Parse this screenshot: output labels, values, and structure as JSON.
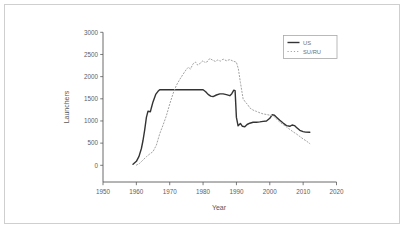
{
  "figure": {
    "background": "#ffffff",
    "border_color": "#cfcfcf"
  },
  "chart_data": {
    "type": "line",
    "title": "",
    "xlabel": "Year",
    "ylabel": "Launchers",
    "xlim": [
      1950,
      2020
    ],
    "ylim": [
      0,
      3000
    ],
    "xticks": [
      "1950",
      "1960",
      "1970",
      "1980",
      "1990",
      "2000",
      "2010",
      "2020"
    ],
    "yticks": [
      "0",
      "500",
      "1000",
      "1500",
      "2000",
      "2500",
      "3000"
    ],
    "grid": false,
    "axis_color": "#5a5a5a",
    "legend": {
      "position": "top-right",
      "entries": [
        "US",
        "SU/RU"
      ]
    },
    "series": [
      {
        "name": "US",
        "line_style": "solid",
        "color": "#333333",
        "points": [
          [
            1959,
            25
          ],
          [
            1960,
            90
          ],
          [
            1960.8,
            200
          ],
          [
            1961.5,
            380
          ],
          [
            1962,
            560
          ],
          [
            1962.5,
            800
          ],
          [
            1963,
            1080
          ],
          [
            1963.5,
            1220
          ],
          [
            1964.2,
            1210
          ],
          [
            1964.5,
            1300
          ],
          [
            1965,
            1430
          ],
          [
            1965.8,
            1600
          ],
          [
            1966.5,
            1670
          ],
          [
            1967,
            1705
          ],
          [
            1980,
            1705
          ],
          [
            1980.8,
            1660
          ],
          [
            1981.5,
            1600
          ],
          [
            1982.3,
            1560
          ],
          [
            1983,
            1550
          ],
          [
            1984,
            1585
          ],
          [
            1985,
            1610
          ],
          [
            1986,
            1610
          ],
          [
            1987,
            1595
          ],
          [
            1988,
            1570
          ],
          [
            1988.6,
            1615
          ],
          [
            1989.2,
            1695
          ],
          [
            1989.6,
            1685
          ],
          [
            1990,
            1080
          ],
          [
            1990.5,
            890
          ],
          [
            1991.2,
            945
          ],
          [
            1991.8,
            880
          ],
          [
            1992.5,
            870
          ],
          [
            1993.2,
            920
          ],
          [
            1994,
            950
          ],
          [
            1995,
            970
          ],
          [
            1996,
            970
          ],
          [
            1997,
            980
          ],
          [
            1998,
            990
          ],
          [
            1999,
            1000
          ],
          [
            2000,
            1060
          ],
          [
            2000.7,
            1140
          ],
          [
            2001.4,
            1130
          ],
          [
            2002,
            1085
          ],
          [
            2003,
            1015
          ],
          [
            2004,
            955
          ],
          [
            2005,
            895
          ],
          [
            2006,
            880
          ],
          [
            2006.7,
            910
          ],
          [
            2007.4,
            895
          ],
          [
            2008,
            855
          ],
          [
            2009,
            790
          ],
          [
            2010,
            760
          ],
          [
            2010.7,
            748
          ],
          [
            2012,
            745
          ]
        ]
      },
      {
        "name": "SU/RU",
        "line_style": "dotted",
        "color": "#a3a3a3",
        "points": [
          [
            1960,
            5
          ],
          [
            1961,
            45
          ],
          [
            1962,
            120
          ],
          [
            1963,
            195
          ],
          [
            1964,
            255
          ],
          [
            1965,
            310
          ],
          [
            1966,
            455
          ],
          [
            1967,
            710
          ],
          [
            1968,
            905
          ],
          [
            1969,
            1120
          ],
          [
            1970,
            1380
          ],
          [
            1971,
            1620
          ],
          [
            1972,
            1805
          ],
          [
            1973,
            1935
          ],
          [
            1974,
            2055
          ],
          [
            1975,
            2165
          ],
          [
            1975.6,
            2210
          ],
          [
            1976.2,
            2170
          ],
          [
            1977,
            2290
          ],
          [
            1977.7,
            2330
          ],
          [
            1978.4,
            2260
          ],
          [
            1979.2,
            2305
          ],
          [
            1980,
            2365
          ],
          [
            1980.6,
            2315
          ],
          [
            1981.4,
            2345
          ],
          [
            1982,
            2410
          ],
          [
            1982.8,
            2375
          ],
          [
            1983.6,
            2345
          ],
          [
            1984.4,
            2375
          ],
          [
            1985.2,
            2350
          ],
          [
            1986,
            2395
          ],
          [
            1987,
            2360
          ],
          [
            1988,
            2385
          ],
          [
            1989,
            2350
          ],
          [
            1990,
            2325
          ],
          [
            1990.6,
            2170
          ],
          [
            1991.2,
            1870
          ],
          [
            1992,
            1500
          ],
          [
            1992.7,
            1425
          ],
          [
            1993.4,
            1365
          ],
          [
            1994,
            1295
          ],
          [
            1995,
            1245
          ],
          [
            1996,
            1215
          ],
          [
            1997,
            1185
          ],
          [
            1998,
            1160
          ],
          [
            1999,
            1145
          ],
          [
            2000,
            1130
          ],
          [
            2001,
            1115
          ],
          [
            2001.6,
            1085
          ],
          [
            2002.2,
            1030
          ],
          [
            2003,
            975
          ],
          [
            2004,
            920
          ],
          [
            2005,
            865
          ],
          [
            2006,
            810
          ],
          [
            2007,
            755
          ],
          [
            2008,
            705
          ],
          [
            2009,
            650
          ],
          [
            2010,
            595
          ],
          [
            2011,
            545
          ],
          [
            2012,
            490
          ]
        ]
      }
    ]
  }
}
